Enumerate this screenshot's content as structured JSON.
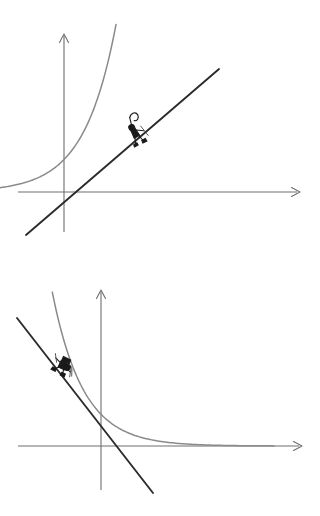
{
  "page": {
    "background_color": "#ffffff",
    "width": 320,
    "height": 516
  },
  "style": {
    "axis_color": "#6e6e6e",
    "curve_color": "#8a8a8a",
    "tangent_color": "#2b2b2b",
    "figure_color": "#1a1a1a"
  },
  "chart_data": [
    {
      "id": "top-panel",
      "type": "line",
      "title": "Exponential growth curve with tangent line",
      "xlabel": "",
      "ylabel": "",
      "grid": false,
      "legend": "none",
      "axes": {
        "x_axis": {
          "from": [
            18,
            192
          ],
          "to": [
            300,
            192
          ],
          "arrow": "right"
        },
        "y_axis": {
          "from": [
            64,
            232
          ],
          "to": [
            64,
            34
          ],
          "arrow": "up"
        },
        "origin": [
          64,
          192
        ]
      },
      "xlim": [
        -2.3,
        6.6
      ],
      "ylim": [
        -1.0,
        5.1
      ],
      "series": [
        {
          "name": "exponential-growth-curve",
          "kind": "curve",
          "color": "#8a8a8a",
          "equation": "y = e^x",
          "x": [
            -2.3,
            -1.8,
            -1.3,
            -0.8,
            -0.3,
            0.2,
            0.7,
            1.2,
            1.5,
            1.8,
            2.0
          ],
          "y": [
            0.1,
            0.17,
            0.27,
            0.45,
            0.74,
            1.22,
            2.01,
            3.32,
            4.48,
            6.05,
            7.39
          ]
        },
        {
          "name": "tangent-line",
          "kind": "line",
          "color": "#2b2b2b",
          "equation": "y = x + 1 (tangent at x = 0)",
          "x": [
            -1.2,
            3.6
          ],
          "y": [
            -1.3,
            2.9
          ]
        }
      ],
      "annotations": [
        {
          "name": "hiker-figure",
          "icon": "hiker-icon",
          "label": "climber ascending the tangent line",
          "at": [
            0.75,
            1.45
          ],
          "pixel_at": [
            126,
            135
          ]
        }
      ]
    },
    {
      "id": "bottom-panel",
      "type": "line",
      "title": "Exponential decay curve with tangent line",
      "xlabel": "",
      "ylabel": "",
      "grid": false,
      "legend": "none",
      "axes": {
        "x_axis": {
          "from": [
            18,
            446
          ],
          "to": [
            302,
            446
          ],
          "arrow": "right"
        },
        "y_axis": {
          "from": [
            101,
            490
          ],
          "to": [
            101,
            290
          ],
          "arrow": "up"
        },
        "origin": [
          101,
          446
        ]
      },
      "xlim": [
        -2.6,
        6.6
      ],
      "ylim": [
        -1.3,
        5.0
      ],
      "series": [
        {
          "name": "exponential-decay-curve",
          "kind": "curve",
          "color": "#8a8a8a",
          "equation": "y = e^(-x)",
          "x": [
            -1.7,
            -1.2,
            -0.7,
            -0.2,
            0.3,
            0.8,
            1.4,
            2.2,
            3.2,
            4.4,
            5.6
          ],
          "y": [
            5.47,
            3.32,
            2.01,
            1.22,
            0.74,
            0.45,
            0.25,
            0.11,
            0.04,
            0.01,
            0.0
          ]
        },
        {
          "name": "tangent-line",
          "kind": "line",
          "color": "#2b2b2b",
          "equation": "y = -x + 1 (tangent at x = 0)",
          "x": [
            -2.2,
            1.6
          ],
          "y": [
            3.9,
            -1.4
          ]
        }
      ],
      "annotations": [
        {
          "name": "skier-figure",
          "icon": "skier-icon",
          "label": "skier descending the tangent line",
          "at": [
            -1.25,
            2.3
          ],
          "pixel_at": [
            78,
            363
          ]
        }
      ]
    }
  ]
}
